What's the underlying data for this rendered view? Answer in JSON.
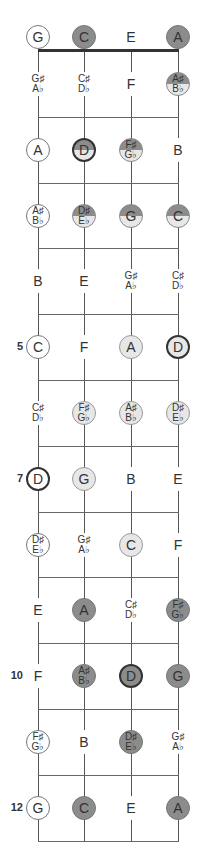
{
  "diagram": {
    "type": "fretboard",
    "strings": [
      "G",
      "C",
      "E",
      "A"
    ],
    "fret_markers": [
      {
        "fret": 5,
        "label": "5"
      },
      {
        "fret": 7,
        "label": "7"
      },
      {
        "fret": 10,
        "label": "10"
      },
      {
        "fret": 12,
        "label": "12"
      }
    ],
    "colors": {
      "dark": "#8c8c8c",
      "light": "#e7e7e7",
      "white": "#ffffff",
      "line": "#555555"
    },
    "frets": [
      {
        "fret": 0,
        "notes": [
          {
            "l1": "G",
            "style": "white"
          },
          {
            "l1": "C",
            "style": "dark"
          },
          {
            "l1": "E",
            "style": "plain"
          },
          {
            "l1": "A",
            "style": "dark"
          }
        ]
      },
      {
        "fret": 1,
        "notes": [
          {
            "l1": "G♯",
            "l2": "A♭",
            "style": "plain"
          },
          {
            "l1": "C♯",
            "l2": "D♭",
            "style": "plain"
          },
          {
            "l1": "F",
            "style": "plain"
          },
          {
            "l1": "A♯",
            "l2": "B♭",
            "style": "half"
          }
        ]
      },
      {
        "fret": 2,
        "notes": [
          {
            "l1": "A",
            "style": "white"
          },
          {
            "l1": "D",
            "style": "half bold"
          },
          {
            "l1": "F♯",
            "l2": "G♭",
            "style": "half"
          },
          {
            "l1": "B",
            "style": "plain"
          }
        ]
      },
      {
        "fret": 3,
        "notes": [
          {
            "l1": "A♯",
            "l2": "B♭",
            "style": "white"
          },
          {
            "l1": "D♯",
            "l2": "E♭",
            "style": "half"
          },
          {
            "l1": "G",
            "style": "half"
          },
          {
            "l1": "C",
            "style": "half"
          }
        ]
      },
      {
        "fret": 4,
        "notes": [
          {
            "l1": "B",
            "style": "plain"
          },
          {
            "l1": "E",
            "style": "plain"
          },
          {
            "l1": "G♯",
            "l2": "A♭",
            "style": "plain"
          },
          {
            "l1": "C♯",
            "l2": "D♭",
            "style": "plain"
          }
        ]
      },
      {
        "fret": 5,
        "notes": [
          {
            "l1": "C",
            "style": "white"
          },
          {
            "l1": "F",
            "style": "plain"
          },
          {
            "l1": "A",
            "style": "light"
          },
          {
            "l1": "D",
            "style": "light bold"
          }
        ]
      },
      {
        "fret": 6,
        "notes": [
          {
            "l1": "C♯",
            "l2": "D♭",
            "style": "plain"
          },
          {
            "l1": "F♯",
            "l2": "G♭",
            "style": "light"
          },
          {
            "l1": "A♯",
            "l2": "B♭",
            "style": "light"
          },
          {
            "l1": "D♯",
            "l2": "E♭",
            "style": "light"
          }
        ]
      },
      {
        "fret": 7,
        "notes": [
          {
            "l1": "D",
            "style": "white bold"
          },
          {
            "l1": "G",
            "style": "light"
          },
          {
            "l1": "B",
            "style": "plain"
          },
          {
            "l1": "E",
            "style": "plain"
          }
        ]
      },
      {
        "fret": 8,
        "notes": [
          {
            "l1": "D♯",
            "l2": "E♭",
            "style": "white"
          },
          {
            "l1": "G♯",
            "l2": "A♭",
            "style": "plain"
          },
          {
            "l1": "C",
            "style": "light"
          },
          {
            "l1": "F",
            "style": "plain"
          }
        ]
      },
      {
        "fret": 9,
        "notes": [
          {
            "l1": "E",
            "style": "plain"
          },
          {
            "l1": "A",
            "style": "dark"
          },
          {
            "l1": "C♯",
            "l2": "D♭",
            "style": "plain"
          },
          {
            "l1": "F♯",
            "l2": "G♭",
            "style": "dark"
          }
        ]
      },
      {
        "fret": 10,
        "notes": [
          {
            "l1": "F",
            "style": "plain"
          },
          {
            "l1": "A♯",
            "l2": "B♭",
            "style": "dark"
          },
          {
            "l1": "D",
            "style": "dark bold"
          },
          {
            "l1": "G",
            "style": "dark"
          }
        ]
      },
      {
        "fret": 11,
        "notes": [
          {
            "l1": "F♯",
            "l2": "G♭",
            "style": "white"
          },
          {
            "l1": "B",
            "style": "plain"
          },
          {
            "l1": "D♯",
            "l2": "E♭",
            "style": "dark"
          },
          {
            "l1": "G♯",
            "l2": "A♭",
            "style": "plain"
          }
        ]
      },
      {
        "fret": 12,
        "notes": [
          {
            "l1": "G",
            "style": "white"
          },
          {
            "l1": "C",
            "style": "dark"
          },
          {
            "l1": "E",
            "style": "plain"
          },
          {
            "l1": "A",
            "style": "dark"
          }
        ]
      }
    ]
  }
}
